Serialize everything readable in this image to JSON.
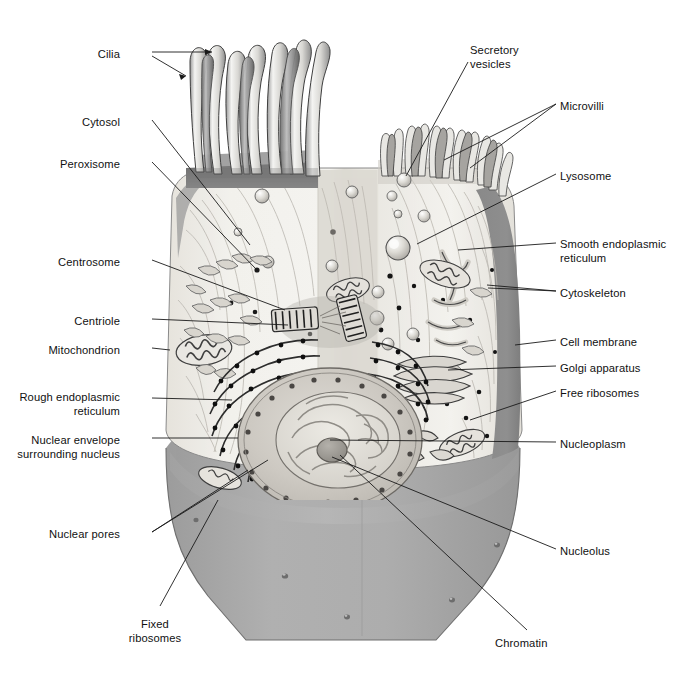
{
  "figure": {
    "kind": "labelled-biology-diagram",
    "background_color": "#ffffff",
    "palette": {
      "line": "#1a1a1a",
      "cytoplasm": "#f1f0ec",
      "cytoplasm_shadow": "#dedbd4",
      "membrane_band": "#8d8d8d",
      "cut_face": "#a9a9a9",
      "cut_face_dark": "#9a9a9a",
      "cut_face_light": "#b6b6b6",
      "nucleus_fill": "#cfccc6",
      "nucleoplasm": "#e3e0d9",
      "nucleolus": "#9d9a95",
      "organelle_outline": "#555555",
      "ribosome_dot": "#111111"
    }
  },
  "labels_left": [
    {
      "id": "cilia",
      "text": "Cilia",
      "x": 120,
      "y": 48,
      "align": "right"
    },
    {
      "id": "cytosol",
      "text": "Cytosol",
      "x": 120,
      "y": 116,
      "align": "right"
    },
    {
      "id": "peroxisome",
      "text": "Peroxisome",
      "x": 120,
      "y": 158,
      "align": "right"
    },
    {
      "id": "centrosome",
      "text": "Centrosome",
      "x": 120,
      "y": 256,
      "align": "right"
    },
    {
      "id": "centriole",
      "text": "Centriole",
      "x": 120,
      "y": 315,
      "align": "right"
    },
    {
      "id": "mitochondrion",
      "text": "Mitochondrion",
      "x": 120,
      "y": 344,
      "align": "right"
    },
    {
      "id": "rough-er",
      "text": "Rough endoplasmic\nreticulum",
      "x": 120,
      "y": 391,
      "align": "right"
    },
    {
      "id": "nuclear-envelope",
      "text": "Nuclear envelope\nsurrounding nucleus",
      "x": 120,
      "y": 434,
      "align": "right"
    },
    {
      "id": "nuclear-pores",
      "text": "Nuclear pores",
      "x": 120,
      "y": 528,
      "align": "right"
    },
    {
      "id": "fixed-ribosomes",
      "text": "Fixed\nribosomes",
      "x": 155,
      "y": 618,
      "align": "center"
    }
  ],
  "labels_right": [
    {
      "id": "secretory-vesicles",
      "text": "Secretory\nvesicles",
      "x": 470,
      "y": 44,
      "align": "left"
    },
    {
      "id": "microvilli",
      "text": "Microvilli",
      "x": 560,
      "y": 100,
      "align": "left"
    },
    {
      "id": "lysosome",
      "text": "Lysosome",
      "x": 560,
      "y": 170,
      "align": "left"
    },
    {
      "id": "smooth-er",
      "text": "Smooth endoplasmic\nreticulum",
      "x": 560,
      "y": 238,
      "align": "left"
    },
    {
      "id": "cytoskeleton",
      "text": "Cytoskeleton",
      "x": 560,
      "y": 287,
      "align": "left"
    },
    {
      "id": "cell-membrane",
      "text": "Cell membrane",
      "x": 560,
      "y": 336,
      "align": "left"
    },
    {
      "id": "golgi",
      "text": "Golgi apparatus",
      "x": 560,
      "y": 362,
      "align": "left"
    },
    {
      "id": "free-ribosomes",
      "text": "Free ribosomes",
      "x": 560,
      "y": 387,
      "align": "left"
    },
    {
      "id": "nucleoplasm",
      "text": "Nucleoplasm",
      "x": 560,
      "y": 438,
      "align": "left"
    },
    {
      "id": "nucleolus",
      "text": "Nucleolus",
      "x": 560,
      "y": 545,
      "align": "left"
    },
    {
      "id": "chromatin",
      "text": "Chromatin",
      "x": 495,
      "y": 637,
      "align": "left"
    }
  ],
  "leader_lines": [
    {
      "id": "cilia-a",
      "points": "152,52 212,52"
    },
    {
      "id": "cilia-b",
      "points": "152,56 186,76"
    },
    {
      "id": "cytosol",
      "points": "152,120 250,245"
    },
    {
      "id": "peroxisome",
      "points": "152,162 257,270"
    },
    {
      "id": "centrosome",
      "points": "152,260 285,310"
    },
    {
      "id": "centriole",
      "points": "152,319 288,325"
    },
    {
      "id": "mitochondrion",
      "points": "152,348 170,350"
    },
    {
      "id": "rough-er",
      "points": "152,398 232,400"
    },
    {
      "id": "nuclear-envelope",
      "points": "152,438 238,438"
    },
    {
      "id": "nuclear-pores-a",
      "points": "152,532 268,460"
    },
    {
      "id": "nuclear-pores-b",
      "points": "152,532 248,470"
    },
    {
      "id": "fixed-ribosomes",
      "points": "160,606 218,500"
    },
    {
      "id": "secretory-vesicles",
      "points": "468,62 406,176"
    },
    {
      "id": "microvilli-a",
      "points": "556,104 444,160"
    },
    {
      "id": "microvilli-b",
      "points": "556,104 470,168"
    },
    {
      "id": "lysosome",
      "points": "556,174 417,244"
    },
    {
      "id": "smooth-er",
      "points": "556,243 458,250"
    },
    {
      "id": "cytoskeleton-a",
      "points": "556,291 487,285"
    },
    {
      "id": "cytoskeleton-b",
      "points": "556,291 488,288"
    },
    {
      "id": "cell-membrane",
      "points": "556,340 515,345"
    },
    {
      "id": "golgi",
      "points": "556,366 448,370"
    },
    {
      "id": "free-ribosomes",
      "points": "556,391 470,420"
    },
    {
      "id": "nucleoplasm",
      "points": "556,442 330,440"
    },
    {
      "id": "nucleolus",
      "points": "556,549 332,457"
    },
    {
      "id": "chromatin",
      "points": "527,630 340,455"
    }
  ]
}
